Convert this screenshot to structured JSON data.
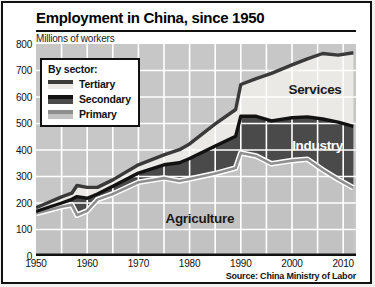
{
  "card": {
    "title": "Employment in China, since 1950",
    "units_label": "Millions of workers",
    "source": "Source: China Ministry of Labor"
  },
  "legend": {
    "title": "By sector:",
    "items": [
      {
        "label": "Tertiary",
        "line_color": "#3a3a3a",
        "fill_color": "#ebe9e5"
      },
      {
        "label": "Secondary",
        "line_color": "#121212",
        "fill_color": "#4a4a4a"
      },
      {
        "label": "Primary",
        "line_color": "#8f8f8f",
        "fill_color": "#c2c2c2"
      }
    ]
  },
  "chart_data": {
    "type": "area",
    "stacked": true,
    "title": "Employment in China, since 1950",
    "ylabel": "Millions of workers",
    "xlabel": "",
    "xlim": [
      1950,
      2012.5
    ],
    "ylim": [
      0,
      800
    ],
    "x_ticks": [
      1950,
      1960,
      1970,
      1980,
      1990,
      2000,
      2010
    ],
    "y_ticks": [
      0,
      100,
      200,
      300,
      400,
      500,
      600,
      700,
      800
    ],
    "grid_x_step_years": 5,
    "grid_y_step": 100,
    "legend_position": "upper-left",
    "x": [
      1950,
      1955,
      1957,
      1958,
      1960,
      1962,
      1965,
      1970,
      1975,
      1978,
      1980,
      1985,
      1989,
      1990,
      1993,
      1996,
      2000,
      2003,
      2006,
      2009,
      2012
    ],
    "series": [
      {
        "name": "Primary",
        "area_label": "Agriculture",
        "values": [
          160,
          186,
          193,
          154,
          170,
          213,
          234,
          278,
          294,
          283,
          291,
          311,
          332,
          389,
          377,
          348,
          360,
          365,
          325,
          289,
          257
        ]
      },
      {
        "name": "Secondary",
        "area_label": "Industry",
        "values": [
          8,
          14,
          21,
          70,
          48,
          21,
          29,
          35,
          50,
          69,
          77,
          104,
          120,
          139,
          150,
          162,
          162,
          160,
          192,
          216,
          232
        ]
      },
      {
        "name": "Tertiary",
        "area_label": "Services",
        "values": [
          14,
          23,
          23,
          42,
          41,
          25,
          24,
          31,
          38,
          49,
          55,
          84,
          101,
          119,
          142,
          179,
          199,
          219,
          247,
          253,
          278
        ]
      }
    ],
    "annotations": [
      {
        "text": "Services",
        "year": 2004.5,
        "value": 630,
        "color": "#1a1a1a"
      },
      {
        "text": "Industry",
        "year": 2005,
        "value": 419,
        "color": "#ffffff"
      },
      {
        "text": "Agriculture",
        "year": 1982,
        "value": 140,
        "color": "#1a1a1a"
      }
    ],
    "colors": {
      "plot_bg": "#c7c7c7",
      "agriculture_fill": "#c2c2c2",
      "industry_fill": "#4a4a4a",
      "services_fill": "#ebe9e5",
      "gridline": "#ffffff",
      "tertiary_line": "#3a3a3a",
      "secondary_line": "#121212",
      "primary_line": "#8f8f8f",
      "primary_line_casing": "#ffffff",
      "axis": "#111111"
    }
  }
}
